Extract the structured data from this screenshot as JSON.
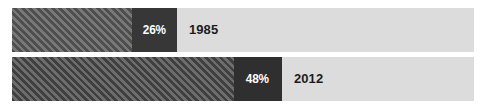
{
  "chart_data": {
    "type": "bar",
    "orientation": "horizontal",
    "title": "",
    "subtitle": "",
    "xlabel": "",
    "ylabel": "",
    "xlim": [
      0,
      100
    ],
    "grid": false,
    "legend": "none",
    "unit": "%",
    "categories": [
      "1985",
      "2012"
    ],
    "values": [
      26,
      48
    ],
    "value_labels": [
      "26%",
      "48%"
    ],
    "series": [
      {
        "name": "Share",
        "values": [
          26,
          48
        ]
      }
    ],
    "bars": [
      {
        "category": "1985",
        "value": 26,
        "value_label": "26%",
        "fill_style": "diagonal-hatch",
        "label_box_width_pct": 9.7
      },
      {
        "category": "2012",
        "value": 48,
        "value_label": "48%",
        "fill_style": "diagonal-hatch",
        "label_box_width_pct": 10.4
      }
    ]
  },
  "colors": {
    "background": "#ffffff",
    "track": "#dcdcdc",
    "hatch_light": "#767676",
    "hatch_dark": "#4e4e4e",
    "label_box": "#373737",
    "pct_text": "#ffffff",
    "year_text": "#1c1c1c"
  }
}
